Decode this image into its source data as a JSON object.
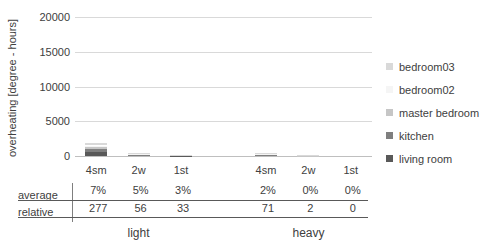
{
  "chart": {
    "y_axis": {
      "title": "overheating [degree - hours]",
      "ticks": [
        "20000",
        "15000",
        "10000",
        "5000",
        "0"
      ]
    },
    "legend": [
      {
        "label": "bedroom03",
        "color": "#d9d9d9"
      },
      {
        "label": "bedroom02",
        "color": "#f5f5f5"
      },
      {
        "label": "master bedroom",
        "color": "#c6c6c6"
      },
      {
        "label": "kitchen",
        "color": "#7f7f7f"
      },
      {
        "label": "living room",
        "color": "#595959"
      }
    ]
  },
  "chart_data": {
    "type": "bar",
    "stacked": true,
    "stack_order": "first-series-at-bottom",
    "title": "",
    "ylabel": "overheating [degree - hours]",
    "xlabel": "",
    "ylim": [
      0,
      20000
    ],
    "gridlines": [
      5000,
      10000,
      15000,
      20000
    ],
    "legend_position": "right",
    "categories": [
      "4sm",
      "2w",
      "1st",
      "4sm",
      "2w",
      "1st"
    ],
    "category_groups": [
      "light",
      "light",
      "light",
      "heavy",
      "heavy",
      "heavy"
    ],
    "series": [
      {
        "name": "living room",
        "color": "#595959",
        "values": [
          580,
          130,
          70,
          130,
          25,
          0
        ]
      },
      {
        "name": "kitchen",
        "color": "#7f7f7f",
        "values": [
          360,
          80,
          40,
          80,
          20,
          0
        ]
      },
      {
        "name": "master bedroom",
        "color": "#c6c6c6",
        "values": [
          290,
          60,
          35,
          60,
          20,
          0
        ]
      },
      {
        "name": "bedroom02",
        "color": "#f5f5f5",
        "values": [
          280,
          40,
          25,
          40,
          10,
          0
        ]
      },
      {
        "name": "bedroom03",
        "color": "#d9d9d9",
        "values": [
          310,
          60,
          40,
          60,
          25,
          0
        ]
      }
    ]
  },
  "table": {
    "rows": [
      {
        "label": "average",
        "values": [
          "7%",
          "5%",
          "3%",
          "2%",
          "0%",
          "0%"
        ]
      },
      {
        "label": "relative",
        "values": [
          "277",
          "56",
          "33",
          "71",
          "2",
          "0"
        ]
      }
    ],
    "group_labels": [
      "light",
      "heavy"
    ]
  }
}
